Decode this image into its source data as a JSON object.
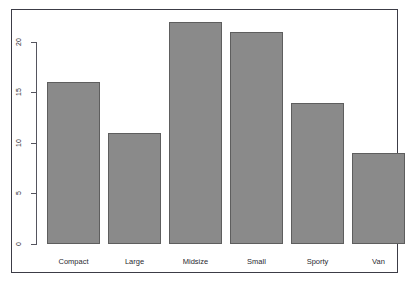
{
  "chart_data": {
    "type": "bar",
    "title": "",
    "subtitle": "",
    "xlabel": "",
    "ylabel": "",
    "categories": [
      "Compact",
      "Large",
      "Midsize",
      "Small",
      "Sporty",
      "Van"
    ],
    "values": [
      16,
      11,
      22,
      21,
      14,
      9
    ],
    "series": [
      {
        "name": "Count",
        "values": [
          16,
          11,
          22,
          21,
          14,
          9
        ]
      }
    ],
    "ylim": [
      0,
      22
    ],
    "yticks": [
      0,
      5,
      10,
      15,
      20
    ],
    "ytick_labels": [
      "0",
      "5",
      "10",
      "15",
      "20"
    ],
    "xticks": [
      "Compact",
      "Large",
      "Midsize",
      "Small",
      "Sporty",
      "Van"
    ],
    "grid": false,
    "legend": null,
    "legend_position": "none",
    "annotations": [],
    "axis_label_rotation": 90,
    "bar_fill_color": "#8a8a8a",
    "bar_border_color": "#5e5e5e",
    "axis_color": "#55555e",
    "frame_color": "#3c3c46",
    "background_color": "#ffffff"
  },
  "figure": {
    "frame_visible": true,
    "y_axis_name": "y-axis",
    "x_axis_name": "x-axis"
  }
}
